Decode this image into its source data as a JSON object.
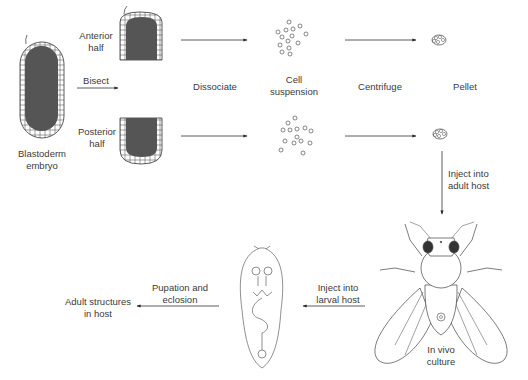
{
  "diagram": {
    "type": "flowchart",
    "labels": {
      "blastoderm": [
        "Blastoderm",
        "embryo"
      ],
      "anterior": [
        "Anterior",
        "half"
      ],
      "posterior": [
        "Posterior",
        "half"
      ],
      "bisect": "Bisect",
      "dissociate": "Dissociate",
      "cell_suspension": [
        "Cell",
        "suspension"
      ],
      "centrifuge": "Centrifuge",
      "pellet": "Pellet",
      "inject_adult": [
        "Inject into",
        "adult host"
      ],
      "in_vivo": [
        "In vivo",
        "culture"
      ],
      "inject_larval": [
        "Inject into",
        "larval host"
      ],
      "pupation": [
        "Pupation and",
        "eclosion"
      ],
      "adult_structures": [
        "Adult structures",
        "in host"
      ]
    },
    "nodes": [
      "Blastoderm embryo",
      "Anterior half",
      "Posterior half",
      "Cell suspension",
      "Pellet",
      "In vivo culture (adult fly)",
      "Larval host",
      "Adult structures in host"
    ],
    "edges": [
      {
        "from": "Blastoderm embryo",
        "to": "Anterior/Posterior half",
        "label": "Bisect"
      },
      {
        "from": "Anterior half",
        "to": "Cell suspension",
        "label": "Dissociate"
      },
      {
        "from": "Cell suspension",
        "to": "Pellet",
        "label": "Centrifuge"
      },
      {
        "from": "Pellet",
        "to": "In vivo culture",
        "label": "Inject into adult host"
      },
      {
        "from": "In vivo culture",
        "to": "Larval host",
        "label": "Inject into larval host"
      },
      {
        "from": "Larval host",
        "to": "Adult structures in host",
        "label": "Pupation and eclosion"
      }
    ],
    "colors": {
      "line": "#333333",
      "yolk": "#555555",
      "background": "#ffffff"
    }
  }
}
